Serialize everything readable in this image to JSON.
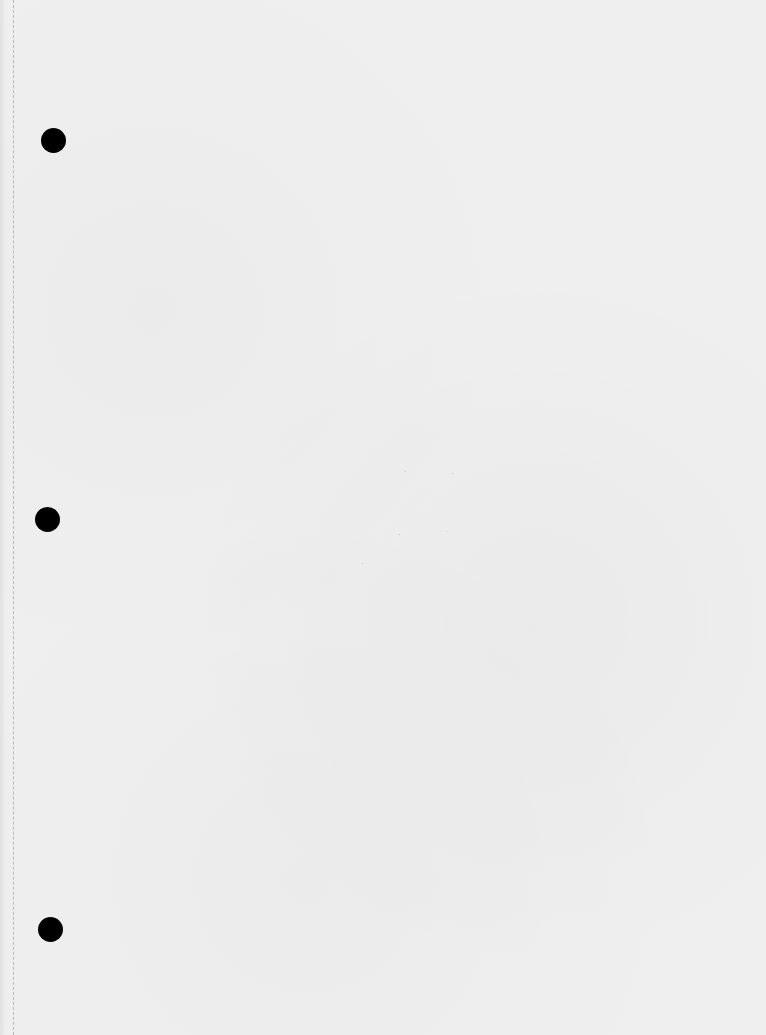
{
  "page": {
    "type": "blank loose-leaf paper",
    "background_color": "#efefef",
    "punch_hole_color": "#000000",
    "punch_holes": [
      {
        "name": "top",
        "x": 53,
        "y": 140,
        "diameter": 25
      },
      {
        "name": "middle",
        "x": 47,
        "y": 519,
        "diameter": 25
      },
      {
        "name": "bottom",
        "x": 50,
        "y": 929,
        "diameter": 25
      }
    ]
  }
}
